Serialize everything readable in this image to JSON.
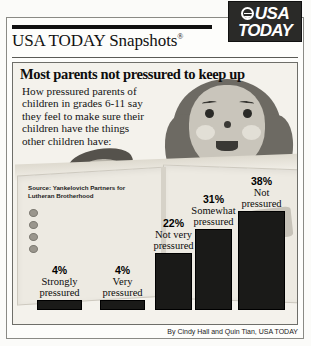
{
  "masthead": {
    "title": "USA TODAY Snapshots",
    "registered_mark": "®"
  },
  "logo": {
    "line1": "USA",
    "line2": "TODAY",
    "globe_icon": "globe-icon"
  },
  "headline": "Most parents not pressured to keep up",
  "description": "How pressured parents of children in grades 6-11 say they feel to make sure their children have the things other children have:",
  "source": "Source: Yankelovich Partners for Lutheran Brotherhood",
  "byline": "By Cindy Hall and Quin Tian, USA TODAY",
  "chart_data": {
    "type": "bar",
    "title": "Most parents not pressured to keep up",
    "xlabel": "",
    "ylabel": "",
    "ylim": [
      0,
      40
    ],
    "grid": false,
    "legend": "none",
    "categories": [
      "Strongly pressured",
      "Very pressured",
      "Not very pressured",
      "Somewhat pressured",
      "Not pressured"
    ],
    "values": [
      4,
      4,
      22,
      31,
      38
    ],
    "value_labels": [
      "4%",
      "4%",
      "22%",
      "31%",
      "38%"
    ],
    "category_lines": [
      [
        "Strongly",
        "pressured"
      ],
      [
        "Very",
        "pressured"
      ],
      [
        "Not very",
        "pressured"
      ],
      [
        "Somewhat",
        "pressured"
      ],
      [
        "Not",
        "pressured"
      ]
    ],
    "bar_color": "#1a1a18"
  },
  "colors": {
    "bar": "#1a1a18",
    "panel_bg": "#f4f2ec",
    "frame": "#8a8a85",
    "logo_bg": "#2a2a28",
    "text": "#0d0d0d"
  }
}
